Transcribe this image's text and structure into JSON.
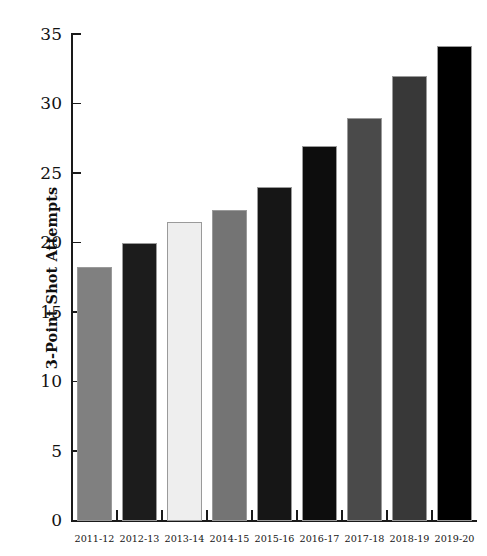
{
  "chart_data": {
    "type": "bar",
    "title": "",
    "xlabel": "",
    "ylabel": "3-Point Shot Attempts",
    "categories": [
      "2011-12",
      "2012-13",
      "2013-14",
      "2014-15",
      "2015-16",
      "2016-17",
      "2017-18",
      "2018-19",
      "2019-20"
    ],
    "values": [
      18.3,
      20.0,
      21.5,
      22.4,
      24.0,
      27.0,
      29.0,
      32.0,
      34.2
    ],
    "bar_colors": [
      "#808080",
      "#1c1c1c",
      "#eeeeee",
      "#747474",
      "#161616",
      "#0d0d0d",
      "#4a4a4a",
      "#383838",
      "#000000"
    ],
    "ylim": [
      0,
      35
    ],
    "yticks": [
      0,
      5,
      10,
      15,
      20,
      25,
      30,
      35
    ],
    "ytick_labels": [
      "0",
      "5",
      "10",
      "15",
      "20",
      "25",
      "30",
      "35"
    ],
    "grid": false,
    "legend": false,
    "legend_position": "none",
    "bar_edge_color": "#9a9a9a"
  }
}
